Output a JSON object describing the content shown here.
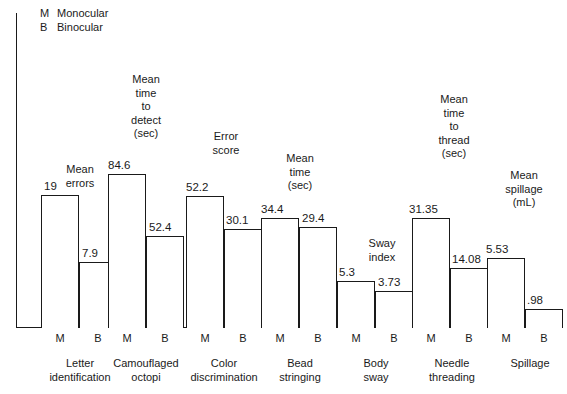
{
  "legend": {
    "rows": [
      {
        "key": "M",
        "label": "Monocular"
      },
      {
        "key": "B",
        "label": "Binocular"
      }
    ]
  },
  "axis": {
    "m_tick": "M",
    "b_tick": "B"
  },
  "chart_data": {
    "type": "bar",
    "title": "",
    "xlabel": "",
    "ylabel": "",
    "grid": false,
    "legend_position": "top-left",
    "note": "Each task group uses its own vertical scale; values are printed above each bar.",
    "series": [
      {
        "name": "Monocular",
        "key": "M"
      },
      {
        "name": "Binocular",
        "key": "B"
      }
    ],
    "categories": [
      "Letter\nidentification",
      "Camouflaged\noctopi",
      "Color\ndiscrimination",
      "Bead\nstringing",
      "Body\nsway",
      "Needle\nthreading",
      "Spillage"
    ],
    "groups": [
      {
        "category": "Letter\nidentification",
        "measure": "Mean\nerrors",
        "monocular": "19",
        "binocular": "7.9",
        "monocular_value": 19,
        "binocular_value": 7.9
      },
      {
        "category": "Camouflaged\noctopi",
        "measure": "Mean\ntime\nto\ndetect\n(sec)",
        "monocular": "84.6",
        "binocular": "52.4",
        "monocular_value": 84.6,
        "binocular_value": 52.4
      },
      {
        "category": "Color\ndiscrimination",
        "measure": "Error\nscore",
        "monocular": "52.2",
        "binocular": "30.1",
        "monocular_value": 52.2,
        "binocular_value": 30.1
      },
      {
        "category": "Bead\nstringing",
        "measure": "Mean\ntime\n(sec)",
        "monocular": "34.4",
        "binocular": "29.4",
        "monocular_value": 34.4,
        "binocular_value": 29.4
      },
      {
        "category": "Body\nsway",
        "measure": "Sway\nindex",
        "monocular": "5.3",
        "binocular": "3.73",
        "monocular_value": 5.3,
        "binocular_value": 3.73
      },
      {
        "category": "Needle\nthreading",
        "measure": "Mean\ntime\nto\nthread\n(sec)",
        "monocular": "31.35",
        "binocular": "14.08",
        "monocular_value": 31.35,
        "binocular_value": 14.08
      },
      {
        "category": "Spillage",
        "measure": "Mean\nspillage\n(mL)",
        "monocular": "5.53",
        "binocular": ".98",
        "monocular_value": 5.53,
        "binocular_value": 0.98
      }
    ]
  },
  "geometry": {
    "baseline_y": 328,
    "bar_width": 38,
    "groups_px": [
      {
        "m_left": 41,
        "b_left": 79,
        "m_h": 133,
        "b_h": 66,
        "m_val_x": 44,
        "m_val_y": 180,
        "b_val_x": 82,
        "b_val_y": 247,
        "lbl_x": 38,
        "lbl_y": 163,
        "lbl_w": 84,
        "cat_x": 26,
        "cat_w": 108
      },
      {
        "m_left": 108,
        "b_left": 146,
        "m_h": 154,
        "b_h": 92,
        "m_val_x": 108,
        "m_val_y": 159,
        "b_val_x": 149,
        "b_val_y": 221,
        "lbl_x": 104,
        "lbl_y": 73,
        "lbl_w": 84,
        "cat_x": 92,
        "cat_w": 108
      },
      {
        "m_left": 186,
        "b_left": 224,
        "m_h": 132,
        "b_h": 99,
        "m_val_x": 186,
        "m_val_y": 181,
        "b_val_x": 226,
        "b_val_y": 214,
        "lbl_x": 184,
        "lbl_y": 130,
        "lbl_w": 84,
        "cat_x": 170,
        "cat_w": 108
      },
      {
        "m_left": 261,
        "b_left": 299,
        "m_h": 110,
        "b_h": 101,
        "m_val_x": 261,
        "m_val_y": 203,
        "b_val_x": 302,
        "b_val_y": 212,
        "lbl_x": 258,
        "lbl_y": 152,
        "lbl_w": 84,
        "cat_x": 246,
        "cat_w": 108
      },
      {
        "m_left": 337,
        "b_left": 375,
        "m_h": 47,
        "b_h": 37,
        "m_val_x": 339,
        "m_val_y": 266,
        "b_val_x": 378,
        "b_val_y": 276,
        "lbl_x": 340,
        "lbl_y": 237,
        "lbl_w": 84,
        "cat_x": 322,
        "cat_w": 108
      },
      {
        "m_left": 412,
        "b_left": 450,
        "m_h": 110,
        "b_h": 60,
        "m_val_x": 409,
        "m_val_y": 203,
        "b_val_x": 452,
        "b_val_y": 253,
        "lbl_x": 412,
        "lbl_y": 93,
        "lbl_w": 84,
        "cat_x": 398,
        "cat_w": 108
      },
      {
        "m_left": 487,
        "b_left": 525,
        "m_h": 70,
        "b_h": 19,
        "m_val_x": 486,
        "m_val_y": 243,
        "b_val_x": 527,
        "b_val_y": 294,
        "lbl_x": 482,
        "lbl_y": 169,
        "lbl_w": 84,
        "cat_x": 476,
        "cat_w": 108
      }
    ]
  }
}
